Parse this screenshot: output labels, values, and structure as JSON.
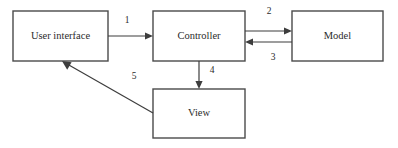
{
  "diagram": {
    "type": "flow-diagram",
    "colors": {
      "background": "#ffffff",
      "box_stroke": "#4a4a4a",
      "edge_stroke": "#3d3d3d",
      "text": "#2b2b2b"
    },
    "nodes": [
      {
        "id": "user-interface",
        "label": "User interface",
        "x": 13,
        "y": 11,
        "width": 95,
        "height": 50
      },
      {
        "id": "controller",
        "label": "Controller",
        "x": 153,
        "y": 11,
        "width": 92,
        "height": 50
      },
      {
        "id": "model",
        "label": "Model",
        "x": 292,
        "y": 11,
        "width": 91,
        "height": 50
      },
      {
        "id": "view",
        "label": "View",
        "x": 153,
        "y": 89,
        "width": 92,
        "height": 49
      }
    ],
    "edges": [
      {
        "id": "edge-1",
        "label": "1",
        "from": "user-interface",
        "to": "controller",
        "label_x": 127,
        "label_y": 21
      },
      {
        "id": "edge-2",
        "label": "2",
        "from": "controller",
        "to": "model",
        "label_x": 269,
        "label_y": 12
      },
      {
        "id": "edge-3",
        "label": "3",
        "from": "model",
        "to": "controller",
        "label_x": 273,
        "label_y": 58
      },
      {
        "id": "edge-4",
        "label": "4",
        "from": "controller",
        "to": "view",
        "label_x": 212,
        "label_y": 71
      },
      {
        "id": "edge-5",
        "label": "5",
        "from": "view",
        "to": "user-interface",
        "label_x": 134,
        "label_y": 77
      }
    ]
  }
}
